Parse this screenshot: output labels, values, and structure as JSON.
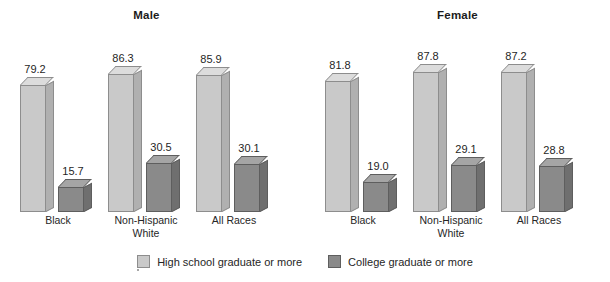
{
  "chart_data": {
    "type": "bar",
    "title": "",
    "xlabel": "",
    "ylabel": "",
    "ylim": [
      0,
      100
    ],
    "grid": false,
    "legend_position": "bottom-center",
    "categories": [
      "Black",
      "Non-Hispanic White",
      "All Races"
    ],
    "panels": [
      {
        "title": "Male",
        "categories": [
          "Black",
          "Non-Hispanic\nWhite",
          "All Races"
        ],
        "series": [
          {
            "name": "High school graduate or more",
            "values": [
              79.2,
              86.3,
              85.9
            ]
          },
          {
            "name": "College graduate or more",
            "values": [
              15.7,
              30.5,
              30.1
            ]
          }
        ]
      },
      {
        "title": "Female",
        "categories": [
          "Black",
          "Non-Hispanic\nWhite",
          "All Races"
        ],
        "series": [
          {
            "name": "High school graduate or more",
            "values": [
              81.8,
              87.8,
              87.2
            ]
          },
          {
            "name": "College graduate or more",
            "values": [
              19.0,
              29.1,
              28.8
            ]
          }
        ]
      }
    ],
    "legend": [
      {
        "label": "High school graduate or more",
        "color": "#c9c9c9"
      },
      {
        "label": "College graduate or more",
        "color": "#8a8a8a"
      }
    ]
  },
  "panels": {
    "male": {
      "title": "Male",
      "groups": [
        {
          "label": "Black",
          "light": {
            "value": "79.2"
          },
          "dark": {
            "value": "15.7"
          }
        },
        {
          "label": "Non-Hispanic\nWhite",
          "light": {
            "value": "86.3"
          },
          "dark": {
            "value": "30.5"
          }
        },
        {
          "label": "All Races",
          "light": {
            "value": "85.9"
          },
          "dark": {
            "value": "30.1"
          }
        }
      ]
    },
    "female": {
      "title": "Female",
      "groups": [
        {
          "label": "Black",
          "light": {
            "value": "81.8"
          },
          "dark": {
            "value": "19.0"
          }
        },
        {
          "label": "Non-Hispanic\nWhite",
          "light": {
            "value": "87.8"
          },
          "dark": {
            "value": "29.1"
          }
        },
        {
          "label": "All Races",
          "light": {
            "value": "87.2"
          },
          "dark": {
            "value": "28.8"
          }
        }
      ]
    }
  },
  "legend": {
    "items": [
      {
        "label": "High school graduate or more",
        "color": "#c9c9c9"
      },
      {
        "label": "College graduate or more",
        "color": "#8a8a8a"
      }
    ]
  },
  "colors": {
    "background": "#ffffff",
    "light_bar_front": "#c9c9c9",
    "light_bar_top": "#dcdcdc",
    "light_bar_side": "#b0b0b0",
    "dark_bar_front": "#8a8a8a",
    "dark_bar_top": "#a5a5a5",
    "dark_bar_side": "#6f6f6f",
    "text": "#262626"
  }
}
